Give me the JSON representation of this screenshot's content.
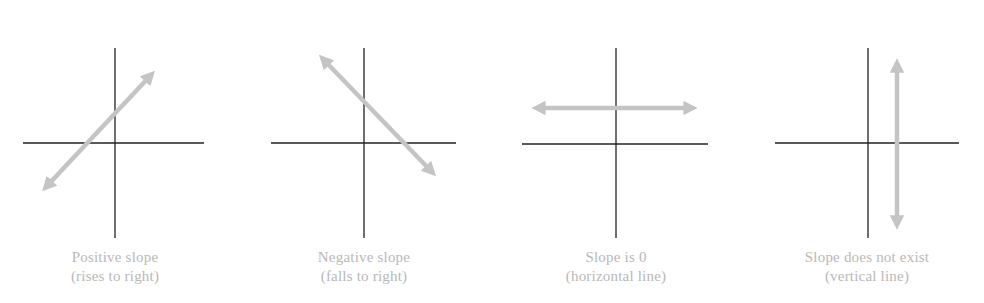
{
  "colors": {
    "axis": "#222222",
    "line": "#c4c4c4",
    "caption": "#b8b8b8",
    "background": "#ffffff"
  },
  "panels": [
    {
      "id": "positive",
      "title": "Positive slope",
      "subtitle": "(rises to right)",
      "line_type": "rising",
      "axes": {
        "origin": [
          115,
          143
        ],
        "x_range": [
          23,
          204
        ],
        "y_range": [
          48,
          238
        ]
      },
      "line": {
        "from": [
          40,
          193
        ],
        "to": [
          157,
          69
        ]
      }
    },
    {
      "id": "negative",
      "title": "Negative slope",
      "subtitle": "(falls to right)",
      "line_type": "falling",
      "axes": {
        "origin": [
          364,
          143
        ],
        "x_range": [
          271,
          456
        ],
        "y_range": [
          48,
          238
        ]
      },
      "line": {
        "from": [
          317,
          53
        ],
        "to": [
          438,
          178
        ]
      }
    },
    {
      "id": "zero",
      "title": "Slope is 0",
      "subtitle": "(horizontal line)",
      "line_type": "horizontal",
      "axes": {
        "origin": [
          616,
          144
        ],
        "x_range": [
          522,
          708
        ],
        "y_range": [
          48,
          238
        ]
      },
      "line": {
        "from": [
          529,
          108
        ],
        "to": [
          700,
          108
        ]
      }
    },
    {
      "id": "undefined",
      "title": "Slope does not exist",
      "subtitle": "(vertical line)",
      "line_type": "vertical",
      "axes": {
        "origin": [
          868,
          143
        ],
        "x_range": [
          775,
          959
        ],
        "y_range": [
          48,
          238
        ]
      },
      "line": {
        "from": [
          897,
          56
        ],
        "to": [
          897,
          232
        ]
      }
    }
  ]
}
